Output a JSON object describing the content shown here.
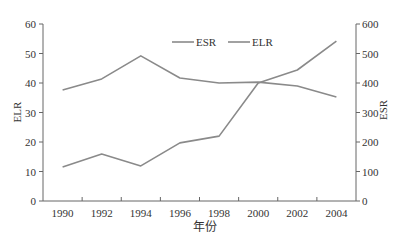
{
  "chart_data": {
    "type": "line",
    "title": "",
    "xlabel": "年份",
    "ylabel_left": "ELR",
    "ylabel_right": "ESR",
    "categories": [
      "1990",
      "1992",
      "1994",
      "1996",
      "1998",
      "2000",
      "2002",
      "2004"
    ],
    "series": [
      {
        "name": "ESR",
        "axis": "right",
        "color": "#8a8a8a",
        "values": [
          115,
          159,
          119,
          197,
          220,
          400,
          444,
          542
        ]
      },
      {
        "name": "ELR",
        "axis": "left",
        "color": "#8a8a8a",
        "values": [
          37.6,
          41.4,
          49.2,
          41.7,
          40.0,
          40.3,
          39.0,
          35.3
        ]
      }
    ],
    "ylim_left": [
      0,
      60
    ],
    "ylim_right": [
      0,
      600
    ],
    "yticks_left": [
      "0",
      "10",
      "20",
      "30",
      "40",
      "50",
      "60"
    ],
    "yticks_right": [
      "0",
      "100",
      "200",
      "300",
      "400",
      "500",
      "600"
    ],
    "grid": false,
    "legend_position": "top-center, inside plot"
  },
  "legend": {
    "items": [
      {
        "label": "ESR"
      },
      {
        "label": "ELR"
      }
    ]
  }
}
